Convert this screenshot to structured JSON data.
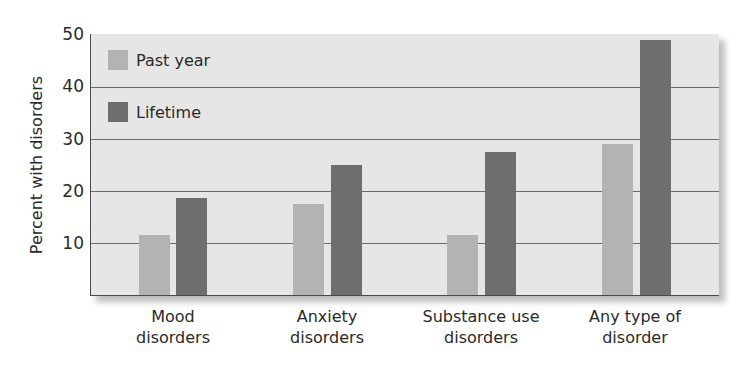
{
  "chart_data": {
    "type": "bar",
    "title": "",
    "xlabel": "",
    "ylabel": "Percent with disorders",
    "ylim": [
      0,
      50
    ],
    "yticks": [
      10,
      20,
      30,
      40,
      50
    ],
    "grid": true,
    "legend_position": "upper-left-inside",
    "categories": [
      [
        "Mood",
        "disorders"
      ],
      [
        "Anxiety",
        "disorders"
      ],
      [
        "Substance use",
        "disorders"
      ],
      [
        "Any type of",
        "disorder"
      ]
    ],
    "series": [
      {
        "name": "Past year",
        "color": "#b3b3b3",
        "values": [
          11.5,
          17.5,
          11.5,
          29
        ]
      },
      {
        "name": "Lifetime",
        "color": "#6e6e6e",
        "values": [
          18.7,
          25,
          27.5,
          49
        ]
      }
    ]
  },
  "axis": {
    "y_label": "Percent with disorders",
    "y_ticks": [
      "50",
      "40",
      "30",
      "20",
      "10"
    ]
  },
  "legend": {
    "past_year": "Past year",
    "lifetime": "Lifetime"
  },
  "colors": {
    "past_year": "#b3b3b3",
    "lifetime": "#6e6e6e",
    "plot_background": "#e6e6e6"
  }
}
